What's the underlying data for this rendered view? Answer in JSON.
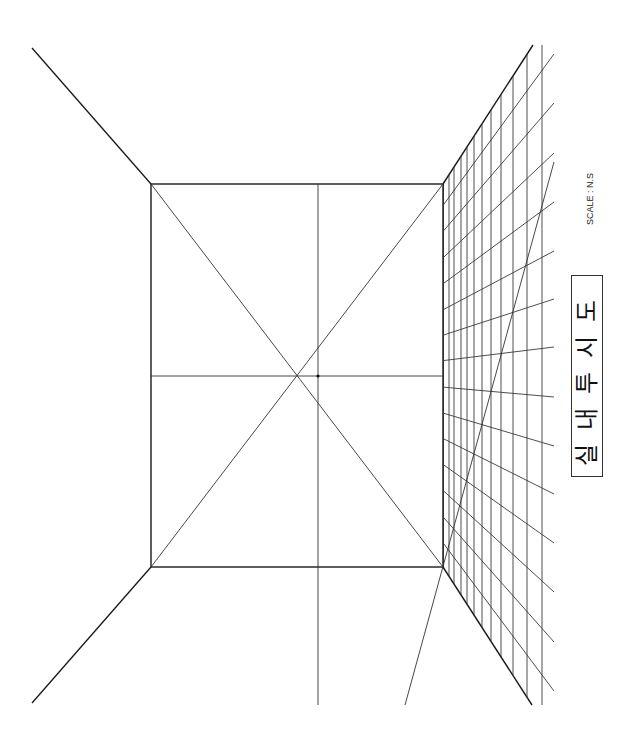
{
  "title": "실내투시도",
  "title_glyphs": [
    "실",
    "내",
    "투",
    "시",
    "도"
  ],
  "scale_label": "SCALE : N.S",
  "drawing": {
    "type": "one-point interior perspective",
    "colors": {
      "line": "#1a1a1a",
      "background": "#ffffff"
    },
    "right_wall_grid": {
      "vertical_line_count": 12,
      "horizontal_line_count": 14
    }
  }
}
